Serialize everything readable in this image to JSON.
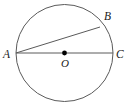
{
  "figure": {
    "type": "geometry-diagram",
    "background_color": "#ffffff",
    "stroke_color": "#5a5a5a",
    "center_dot_color": "#000000",
    "label_color": "#1a1a1a",
    "canvas": {
      "width": 129,
      "height": 104
    },
    "circle": {
      "name": "circle-O",
      "center": {
        "x": 64.5,
        "y": 53
      },
      "radius": 48.5,
      "stroke_width": 1
    },
    "center_point": {
      "label": "O",
      "x": 64.5,
      "y": 53,
      "dot_radius": 2.4
    },
    "points": [
      {
        "id": "A",
        "label": "A",
        "x": 16,
        "y": 53,
        "on": "circle",
        "note": "left endpoint of diameter"
      },
      {
        "id": "B",
        "label": "B",
        "x": 100,
        "y": 27,
        "on": "circle",
        "note": "upper right point of chord"
      },
      {
        "id": "C",
        "label": "C",
        "x": 113,
        "y": 53,
        "on": "circle",
        "note": "right endpoint of diameter"
      }
    ],
    "segments": [
      {
        "id": "AC",
        "label": "AC",
        "from": "A",
        "to": "C",
        "kind": "diameter",
        "x1": 16,
        "y1": 53,
        "x2": 113,
        "y2": 53
      },
      {
        "id": "AB",
        "label": "AB",
        "from": "A",
        "to": "B",
        "kind": "chord",
        "x1": 16,
        "y1": 53,
        "x2": 100,
        "y2": 27
      }
    ],
    "labels": {
      "A": "A",
      "B": "B",
      "C": "C",
      "O": "O"
    }
  }
}
